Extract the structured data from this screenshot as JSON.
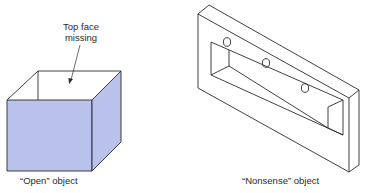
{
  "figure": {
    "left": {
      "caption": "“Open” object",
      "annotation_line1": "Top face",
      "annotation_line2": "missing",
      "fill_color": "#b8c2ea"
    },
    "right": {
      "caption": "“Nonsense” object",
      "hole_count": 3
    },
    "stroke_color": "#2a2a2a"
  }
}
